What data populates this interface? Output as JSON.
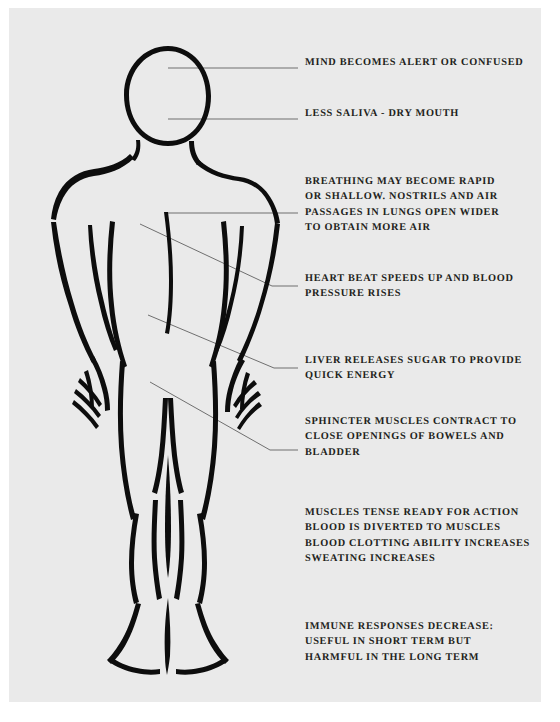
{
  "poster": {
    "title": "Body responses to stress diagram",
    "paper_color": "#eaeaea",
    "ink_color": "#0d0d0d",
    "text_color": "#231f20",
    "leader_color": "#6f6f6f",
    "figure_name": "human-body-outline"
  },
  "labels": [
    {
      "name": "label-mind",
      "x": 305,
      "y": 61,
      "lines": [
        "MIND BECOMES ALERT OR CONFUSED"
      ]
    },
    {
      "name": "label-saliva",
      "x": 305,
      "y": 112,
      "lines": [
        "LESS SALIVA - DRY MOUTH"
      ]
    },
    {
      "name": "label-breathing",
      "x": 305,
      "y": 180,
      "lines": [
        "BREATHING MAY BECOME RAPID",
        "OR SHALLOW. NOSTRILS AND AIR",
        "PASSAGES IN LUNGS OPEN WIDER",
        "TO OBTAIN MORE AIR"
      ]
    },
    {
      "name": "label-heart",
      "x": 305,
      "y": 277,
      "lines": [
        "HEART BEAT SPEEDS UP AND BLOOD",
        "PRESSURE RISES"
      ]
    },
    {
      "name": "label-liver",
      "x": 305,
      "y": 359,
      "lines": [
        "LIVER RELEASES SUGAR TO PROVIDE",
        "QUICK ENERGY"
      ]
    },
    {
      "name": "label-sphincter",
      "x": 305,
      "y": 420,
      "lines": [
        "SPHINCTER MUSCLES CONTRACT TO",
        "CLOSE OPENINGS OF BOWELS AND",
        "BLADDER"
      ]
    },
    {
      "name": "label-muscles",
      "x": 305,
      "y": 511,
      "lines": [
        "MUSCLES TENSE READY FOR ACTION",
        "BLOOD IS DIVERTED TO MUSCLES",
        "BLOOD CLOTTING ABILITY INCREASES",
        "SWEATING INCREASES"
      ]
    },
    {
      "name": "label-immune",
      "x": 305,
      "y": 625,
      "lines": [
        "IMMUNE RESPONSES DECREASE:",
        "USEFUL IN SHORT TERM BUT",
        "HARMFUL IN THE LONG TERM"
      ]
    }
  ],
  "leaders": [
    {
      "name": "leader-mind",
      "points": "168,68 298,68"
    },
    {
      "name": "leader-saliva",
      "points": "168,119 298,119"
    },
    {
      "name": "leader-breathing",
      "points": "166,213 298,213"
    },
    {
      "name": "leader-heart",
      "points": "140,224 272,286 298,286"
    },
    {
      "name": "leader-liver",
      "points": "148,315 274,368 298,368"
    },
    {
      "name": "leader-sphincter",
      "points": "150,382 270,450 298,450"
    }
  ]
}
